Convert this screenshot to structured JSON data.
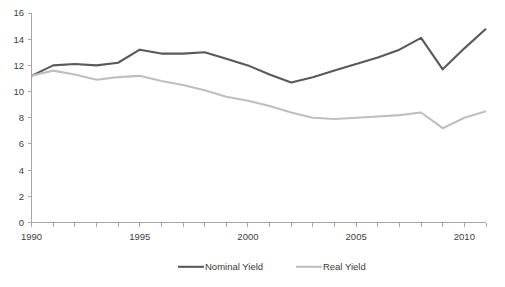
{
  "chart_data": {
    "type": "line",
    "title": "",
    "xlabel": "",
    "ylabel": "",
    "x": [
      1990,
      1991,
      1992,
      1993,
      1994,
      1995,
      1996,
      1997,
      1998,
      1999,
      2000,
      2001,
      2002,
      2003,
      2004,
      2005,
      2006,
      2007,
      2008,
      2009,
      2010,
      2011
    ],
    "xlim": [
      1990,
      2011
    ],
    "ylim": [
      0,
      16
    ],
    "yticks": [
      0,
      2,
      4,
      6,
      8,
      10,
      12,
      14,
      16
    ],
    "ytick_labels": [
      "0",
      "2",
      "4",
      "6",
      "8",
      "10",
      "12",
      "14",
      "16"
    ],
    "xtick_labels_shown": [
      "1990",
      "1995",
      "2000",
      "2005",
      "2010"
    ],
    "xtick_label_values": [
      1990,
      1995,
      2000,
      2005,
      2010
    ],
    "grid": false,
    "legend_position": "bottom",
    "series": [
      {
        "name": "Nominal Yield",
        "color": "#595959",
        "values": [
          11.2,
          12.0,
          12.1,
          12.0,
          12.2,
          13.2,
          12.9,
          12.9,
          13.0,
          12.5,
          12.0,
          11.3,
          10.7,
          11.1,
          11.6,
          12.1,
          12.6,
          13.2,
          14.1,
          11.7,
          13.3,
          14.8
        ]
      },
      {
        "name": "Real Yield",
        "color": "#bfbfbf",
        "values": [
          11.2,
          11.6,
          11.3,
          10.9,
          11.1,
          11.2,
          10.8,
          10.5,
          10.1,
          9.6,
          9.3,
          8.9,
          8.4,
          8.0,
          7.9,
          8.0,
          8.1,
          8.2,
          8.4,
          7.2,
          8.0,
          8.5
        ]
      }
    ]
  },
  "legend": {
    "entries": [
      {
        "label": "Nominal Yield",
        "color": "#595959"
      },
      {
        "label": "Real Yield",
        "color": "#bfbfbf"
      }
    ]
  },
  "axes": {
    "y_axis_color": "#a6a6a6",
    "x_axis_color": "#a6a6a6",
    "tick_text_color": "#404040"
  }
}
